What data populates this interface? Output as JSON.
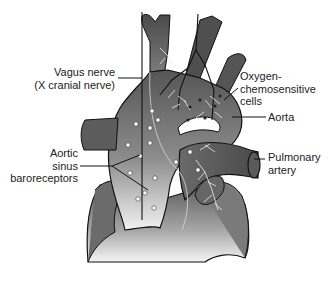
{
  "diagram": {
    "colors": {
      "tissue_dark": "#5a5a5a",
      "tissue_mid": "#8a8a8a",
      "tissue_light": "#e6e6e6",
      "outline": "#111111",
      "nerve": "#f2f2f2",
      "background": "#ffffff"
    },
    "labels": {
      "vagus": {
        "line1": "Vagus nerve",
        "line2": "(X cranial nerve)"
      },
      "chemo": {
        "line1": "Oxygen-",
        "line2": "chemosensitive",
        "line3": "cells"
      },
      "aorta": {
        "line1": "Aorta"
      },
      "baro": {
        "line1": "Aortic",
        "line2": "sinus",
        "line3": "baroreceptors"
      },
      "pulmonary": {
        "line1": "Pulmonary",
        "line2": "artery"
      }
    }
  }
}
